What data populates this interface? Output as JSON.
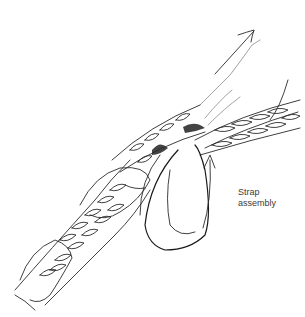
{
  "figure": {
    "label": {
      "line1": "Strap",
      "line2": "assembly"
    },
    "arrows": [
      {
        "name": "pull-direction",
        "points_to": "upper-right"
      },
      {
        "name": "strap-direction",
        "points_to": "up"
      }
    ]
  }
}
